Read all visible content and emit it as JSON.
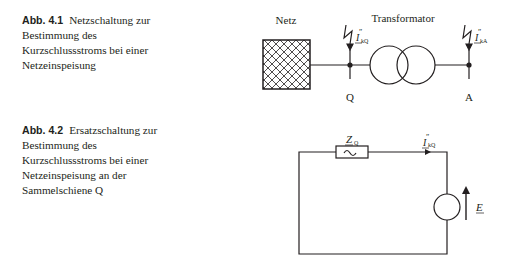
{
  "figures": [
    {
      "label": "Abb. 4.1",
      "caption_lines": [
        "Netzschaltung zur",
        "Bestimmung des",
        "Kurzschlussstroms bei einer",
        "Netzeinspeisung"
      ],
      "diagram": {
        "netz_label": "Netz",
        "transformer_label": "Transformator",
        "node_q_label": "Q",
        "node_a_label": "A",
        "current_q_main": "I",
        "current_q_prime": "″",
        "current_q_sub": "kQ",
        "current_a_main": "I",
        "current_a_prime": "″",
        "current_a_sub": "kA"
      }
    },
    {
      "label": "Abb. 4.2",
      "caption_lines": [
        "Ersatzschaltung zur",
        "Bestimmung des",
        "Kurzschlussstroms bei einer",
        "Netzeinspeisung an der",
        "Sammelschiene Q"
      ],
      "diagram": {
        "impedance_main": "Z",
        "impedance_sub": "Q",
        "current_main": "I",
        "current_prime": "″",
        "current_sub": "kQ",
        "source_label": "E",
        "impedance_symbol": "~"
      }
    }
  ],
  "colors": {
    "line": "#231f20",
    "background": "#ffffff"
  }
}
